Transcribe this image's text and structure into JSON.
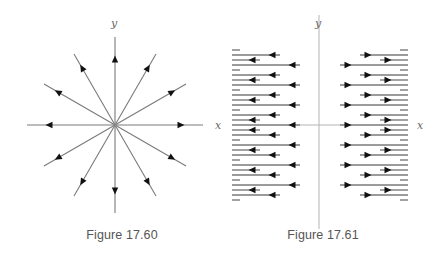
{
  "figures": [
    {
      "id": "fig-17-60",
      "caption": "Figure 17.60",
      "caption_pos": {
        "x": 122,
        "y": 228
      },
      "type": "radial_field",
      "center": {
        "x": 115,
        "y": 125
      },
      "x_label": "x",
      "y_label": "y",
      "x_label_pos": {
        "x": 215,
        "y": 129
      },
      "y_label_pos": {
        "x": 114,
        "y": 27
      },
      "ray_count": 12,
      "ray_angle_step_deg": 30,
      "axis_ray_length": 88,
      "diagonal_ray_length": 82,
      "arrow_radius": 66,
      "arrow_direction": "outward"
    },
    {
      "id": "fig-17-61",
      "caption": "Figure 17.61",
      "caption_pos": {
        "x": 323,
        "y": 228
      },
      "type": "horizontal_field",
      "x_label": "x",
      "y_label": "y",
      "x_label_pos": {
        "x": 417,
        "y": 129
      },
      "y_label_pos": {
        "x": 318,
        "y": 27
      },
      "y_axis": {
        "x": 319,
        "y1": 15,
        "y2": 229
      },
      "x_axis": {
        "y": 125,
        "x1": 232,
        "x2": 408
      },
      "left_block": {
        "x_start": 232,
        "dash_end": 240,
        "ends": {
          "S": 260,
          "M": 280,
          "L": 300
        },
        "arrows": {
          "S": 252,
          "M": 272,
          "L": 292
        },
        "direction": "left"
      },
      "right_block": {
        "x_end": 408,
        "dash_start": 400,
        "starts": {
          "S": 380,
          "M": 360,
          "L": 340
        },
        "arrows": {
          "S": 388,
          "M": 368,
          "L": 348
        },
        "direction": "right"
      },
      "rows": [
        {
          "y": 50,
          "kind": "dash"
        },
        {
          "y": 55,
          "kind": "M"
        },
        {
          "y": 60,
          "kind": "S"
        },
        {
          "y": 65,
          "kind": "L"
        },
        {
          "y": 70,
          "kind": "dash"
        },
        {
          "y": 75,
          "kind": "M"
        },
        {
          "y": 80,
          "kind": "S"
        },
        {
          "y": 85,
          "kind": "L"
        },
        {
          "y": 90,
          "kind": "dash"
        },
        {
          "y": 95,
          "kind": "M"
        },
        {
          "y": 100,
          "kind": "S"
        },
        {
          "y": 105,
          "kind": "L"
        },
        {
          "y": 110,
          "kind": "dash"
        },
        {
          "y": 115,
          "kind": "M"
        },
        {
          "y": 120,
          "kind": "S"
        },
        {
          "y": 125,
          "kind": "L"
        },
        {
          "y": 130,
          "kind": "S"
        },
        {
          "y": 135,
          "kind": "M"
        },
        {
          "y": 140,
          "kind": "dash"
        },
        {
          "y": 145,
          "kind": "L"
        },
        {
          "y": 150,
          "kind": "S"
        },
        {
          "y": 155,
          "kind": "M"
        },
        {
          "y": 160,
          "kind": "dash"
        },
        {
          "y": 165,
          "kind": "L"
        },
        {
          "y": 170,
          "kind": "S"
        },
        {
          "y": 175,
          "kind": "M"
        },
        {
          "y": 180,
          "kind": "dash"
        },
        {
          "y": 185,
          "kind": "L"
        },
        {
          "y": 190,
          "kind": "S"
        },
        {
          "y": 195,
          "kind": "M"
        },
        {
          "y": 200,
          "kind": "dash"
        }
      ]
    }
  ],
  "colors": {
    "line": "#7a7a7a",
    "axis": "#b5b5b5",
    "arrow": "#111111",
    "caption": "#555555"
  }
}
